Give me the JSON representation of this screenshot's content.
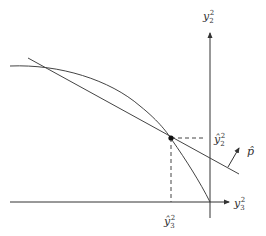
{
  "diagram": {
    "axes": {
      "vertical": {
        "label": "y",
        "sub": "2",
        "sup": "2"
      },
      "horizontal": {
        "label": "y",
        "sub": "3",
        "sup": "2"
      }
    },
    "optimal_point": {
      "y_label": {
        "label": "ŷ",
        "sub": "2",
        "sup": "2"
      },
      "x_label": {
        "label": "ŷ",
        "sub": "3",
        "sup": "2"
      }
    },
    "price_vector": {
      "label": "p̂"
    },
    "elements": [
      "production possibility frontier",
      "tangent iso-revenue line",
      "optimal point",
      "price vector"
    ]
  }
}
